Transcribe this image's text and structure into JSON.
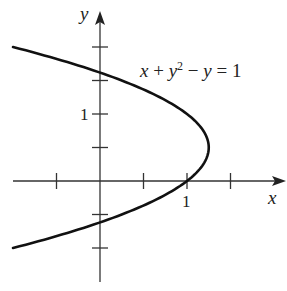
{
  "chart_data": {
    "type": "line",
    "title": "",
    "equation": "x + y^2 - y = 1",
    "equation_parts": {
      "a": "x + y",
      "sup": "2",
      "b": " − y = 1"
    },
    "xlabel": "x",
    "ylabel": "y",
    "xlim": [
      -1.0,
      2.1
    ],
    "ylim": [
      -1.4,
      2.5
    ],
    "x_ticks": [
      -0.5,
      0,
      0.5,
      1,
      1.5
    ],
    "y_ticks": [
      -1,
      -0.5,
      0.5,
      1,
      1.5,
      2
    ],
    "x_tick_labels": [
      {
        "value": 1,
        "label": "1"
      }
    ],
    "y_tick_labels": [
      {
        "value": 1,
        "label": "1"
      }
    ],
    "grid": false,
    "series": [
      {
        "name": "x + y^2 - y = 1",
        "description": "parabola x = 1 + y - y^2 opening left, vertex (1.25, 0.5)",
        "points": [
          {
            "x": -1.0,
            "y": 2.0
          },
          {
            "x": 0.0,
            "y": 1.618
          },
          {
            "x": 1.0,
            "y": 1.0
          },
          {
            "x": 1.25,
            "y": 0.5
          },
          {
            "x": 1.0,
            "y": 0.0
          },
          {
            "x": 0.0,
            "y": -0.618
          },
          {
            "x": -1.0,
            "y": -1.0
          }
        ]
      }
    ]
  },
  "labels": {
    "x_axis": "x",
    "y_axis": "y",
    "one_x": "1",
    "one_y": "1"
  },
  "colors": {
    "curve": "#111111",
    "axis": "#333333"
  }
}
